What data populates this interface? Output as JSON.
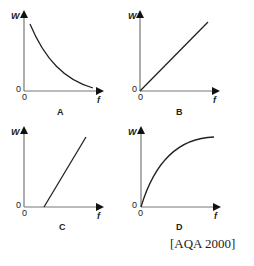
{
  "graphs": [
    {
      "id": "A",
      "ylabel": "W",
      "xlabel": "f",
      "origin_y": "0",
      "origin_x": "0",
      "shape": "decreasing curve"
    },
    {
      "id": "B",
      "ylabel": "W",
      "xlabel": "f",
      "origin_y": "0",
      "origin_x": "0",
      "shape": "straight line through origin"
    },
    {
      "id": "C",
      "ylabel": "W",
      "xlabel": "f",
      "origin_y": "0",
      "origin_x": "0",
      "shape": "straight line with positive x-intercept"
    },
    {
      "id": "D",
      "ylabel": "W",
      "xlabel": "f",
      "origin_y": "0",
      "origin_x": "0",
      "shape": "increasing curve levelling off"
    }
  ],
  "source": "[AQA 2000]"
}
